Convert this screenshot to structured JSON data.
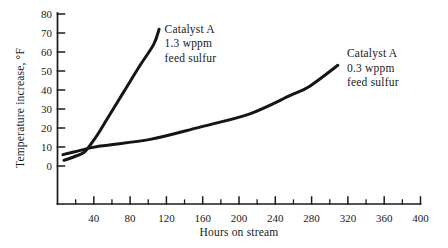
{
  "figure": {
    "background": "#ffffff",
    "ink_color": "#1a1a1a",
    "curve_color": "#151515"
  },
  "chart_data": {
    "type": "line",
    "title": "",
    "xlabel": "Hours on stream",
    "ylabel": "Temperature increase, °F",
    "xlim": [
      0,
      400
    ],
    "ylim": [
      0,
      80
    ],
    "grid": false,
    "legend_position": "inline-annotations",
    "x_ticks": {
      "major_labels": [
        40,
        80,
        120,
        160,
        200,
        240,
        280,
        320,
        360,
        400
      ],
      "minor_ticks": [
        20,
        60,
        100,
        140,
        180,
        220,
        260,
        300,
        340,
        380
      ]
    },
    "y_ticks": [
      0,
      10,
      20,
      30,
      40,
      50,
      60,
      70,
      80
    ],
    "series": [
      {
        "name": "Catalyst A 1.3 wppm feed sulfur",
        "points": [
          [
            7,
            3
          ],
          [
            19,
            5
          ],
          [
            30,
            7.5
          ],
          [
            42,
            15
          ],
          [
            55,
            25
          ],
          [
            73,
            39
          ],
          [
            91,
            53
          ],
          [
            106,
            64
          ],
          [
            112,
            72
          ]
        ]
      },
      {
        "name": "Catalyst A 0.3 wppm feed sulfur",
        "points": [
          [
            6,
            6
          ],
          [
            19,
            7.5
          ],
          [
            47,
            10.5
          ],
          [
            102,
            14
          ],
          [
            157,
            20.5
          ],
          [
            212,
            27.5
          ],
          [
            256,
            37
          ],
          [
            278,
            42
          ],
          [
            309,
            53
          ]
        ]
      }
    ],
    "annotations": [
      {
        "lines": [
          "Catalyst A",
          "1.3 wppm",
          "feed sulfur"
        ],
        "x": 118,
        "y": 76
      },
      {
        "lines": [
          "Catalyst A",
          "0.3 wppm",
          "feed sulfur"
        ],
        "x": 319,
        "y": 63
      }
    ]
  }
}
